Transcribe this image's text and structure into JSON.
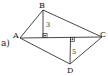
{
  "figure": {
    "label": "a)",
    "points": {
      "A": {
        "name": "A",
        "x": 20,
        "y": 38
      },
      "B": {
        "name": "B",
        "x": 43,
        "y": 10
      },
      "C": {
        "name": "C",
        "x": 102,
        "y": 37
      },
      "D": {
        "name": "D",
        "x": 70,
        "y": 64
      },
      "H1": {
        "x": 43,
        "y": 37
      },
      "H2": {
        "x": 71,
        "y": 37
      }
    },
    "segments": [
      {
        "from": "A",
        "to": "B"
      },
      {
        "from": "B",
        "to": "C"
      },
      {
        "from": "C",
        "to": "D"
      },
      {
        "from": "D",
        "to": "A"
      },
      {
        "from": "A",
        "to": "C"
      },
      {
        "from": "B",
        "to": "H1"
      },
      {
        "from": "D",
        "to": "H2"
      }
    ],
    "heights": {
      "BH1": "3",
      "DH2": "5"
    },
    "right_angle_marks": [
      "H1",
      "H2"
    ],
    "stroke_color": "#333333"
  }
}
